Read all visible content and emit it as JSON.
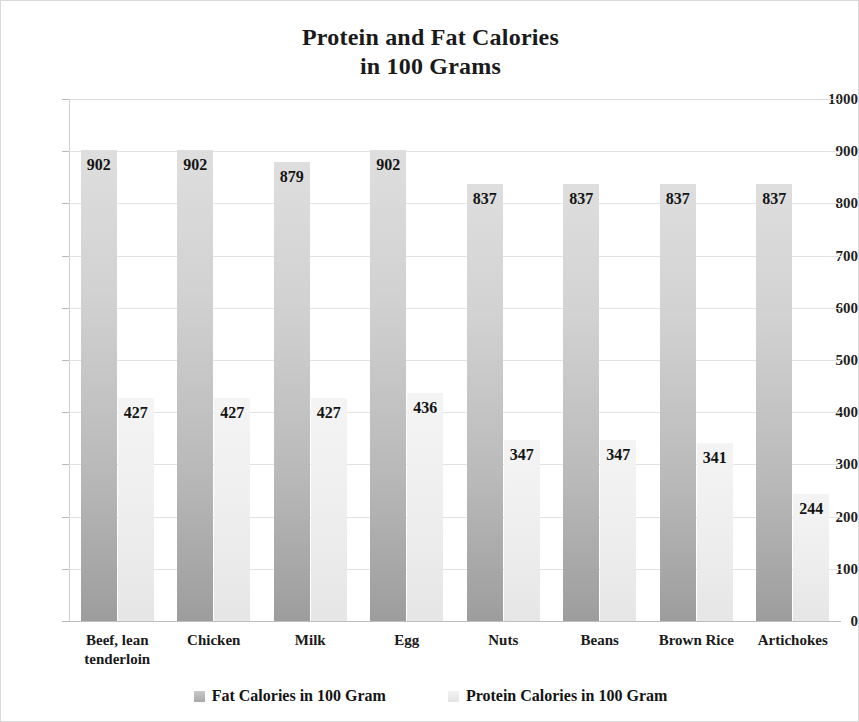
{
  "chart_data": {
    "type": "bar",
    "title": "Protein and Fat Calories in 100 Grams",
    "title_line1": "Protein and Fat Calories",
    "title_line2": "in 100 Grams",
    "xlabel": "",
    "ylabel": "",
    "ylim": [
      0,
      1000
    ],
    "ytick_step": 100,
    "yticks": [
      "1000",
      "900",
      "800",
      "700",
      "600",
      "500",
      "400",
      "300",
      "200",
      "100",
      "0"
    ],
    "grid": true,
    "legend_position": "bottom",
    "categories": [
      "Beef, lean tenderloin",
      "Chicken",
      "Milk",
      "Egg",
      "Nuts",
      "Beans",
      "Brown Rice",
      "Artichokes"
    ],
    "category_lines": [
      [
        "Beef, lean",
        "tenderloin"
      ],
      [
        "Chicken"
      ],
      [
        "Milk"
      ],
      [
        "Egg"
      ],
      [
        "Nuts"
      ],
      [
        "Beans"
      ],
      [
        "Brown Rice"
      ],
      [
        "Artichokes"
      ]
    ],
    "series": [
      {
        "name": "Fat Calories in 100 Gram",
        "color": "#b9b9b9",
        "values": [
          902,
          902,
          879,
          902,
          837,
          837,
          837,
          837
        ]
      },
      {
        "name": "Protein Calories in 100 Gram",
        "color": "#ededed",
        "values": [
          427,
          427,
          427,
          436,
          347,
          347,
          341,
          244
        ]
      }
    ]
  },
  "legend": {
    "items": [
      {
        "label": "Fat Calories in 100 Gram",
        "swatch": "fat"
      },
      {
        "label": "Protein Calories in 100 Gram",
        "swatch": "protein"
      }
    ]
  },
  "colors": {
    "fat_bar": "#b9b9b9",
    "protein_bar": "#ededed",
    "gridline": "#e2e2e2",
    "text": "#1a1a1a",
    "frame": "#d9d9d9"
  }
}
